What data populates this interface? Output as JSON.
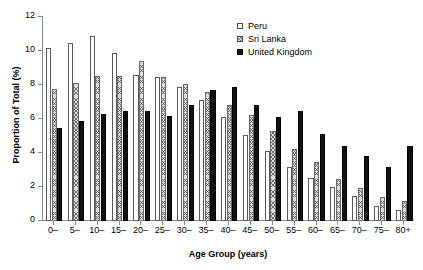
{
  "chart_data": {
    "type": "bar",
    "title": "",
    "xlabel": "Age Group (years)",
    "ylabel": "Proportion of Total (%)",
    "ylim": [
      0,
      12
    ],
    "yticks": [
      0,
      2,
      4,
      6,
      8,
      10,
      12
    ],
    "grid": false,
    "legend_position": "top-right",
    "categories": [
      "0–",
      "5–",
      "10–",
      "15–",
      "20–",
      "25–",
      "30–",
      "35–",
      "40–",
      "45–",
      "50–",
      "55–",
      "60–",
      "65–",
      "70–",
      "75–",
      "80+"
    ],
    "series": [
      {
        "name": "Peru",
        "style": "open-white",
        "values": [
          10.15,
          10.5,
          10.9,
          9.9,
          8.6,
          8.5,
          7.9,
          7.1,
          6.1,
          5.05,
          4.1,
          3.2,
          2.55,
          2.0,
          1.45,
          0.9,
          0.65
        ]
      },
      {
        "name": "Sri Lanka",
        "style": "hatched-gray",
        "values": [
          7.75,
          8.1,
          8.55,
          8.55,
          9.4,
          8.5,
          8.05,
          7.6,
          6.85,
          6.25,
          5.3,
          4.25,
          3.45,
          2.5,
          1.95,
          1.4,
          1.2
        ]
      },
      {
        "name": "United Kingdom",
        "style": "solid-black",
        "values": [
          5.45,
          5.9,
          6.3,
          6.5,
          6.45,
          6.2,
          6.8,
          7.7,
          7.9,
          6.85,
          6.1,
          6.5,
          5.1,
          4.4,
          3.8,
          3.15,
          4.4
        ]
      }
    ]
  }
}
